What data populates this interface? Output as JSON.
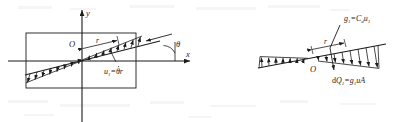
{
  "figure": {
    "background_color": "#ffffff",
    "ink_color": "#1b1b1b",
    "panels": [
      {
        "id": "left-panel",
        "name": "coordinate-axes-panel",
        "description": "x-y axes with rectangular body and inclined line carrying a triangular velocity distribution",
        "axes": {
          "x_label": "x",
          "y_label": "y",
          "origin_label": "O"
        },
        "labels": {
          "radius": "r",
          "angle": "θ",
          "velocity": "u",
          "velocity_sub": "1",
          "velocity_rhs": "=θr",
          "velocity_full": "u₁=θr"
        }
      },
      {
        "id": "right-panel",
        "name": "drag-distribution-panel",
        "description": "inclined line with opposed arrow distribution, drag intensity and elemental flow labels",
        "labels": {
          "origin": "O",
          "radius": "r",
          "drag_intensity": "g₁=C_d u₁",
          "drag_intensity_lhs": "g",
          "drag_intensity_lhs_sub": "1",
          "drag_intensity_rhs": "=C",
          "drag_intensity_rhs_sub": "d",
          "drag_intensity_tail": "u",
          "drag_intensity_tail_sub": "1",
          "elemental_flow": "dQ₁=g₁uA",
          "elemental_flow_d": "d",
          "elemental_flow_Q": "Q",
          "elemental_flow_Q_sub": "1",
          "elemental_flow_eq": "=g",
          "elemental_flow_g_sub": "1",
          "elemental_flow_tail": "uA"
        }
      }
    ]
  }
}
